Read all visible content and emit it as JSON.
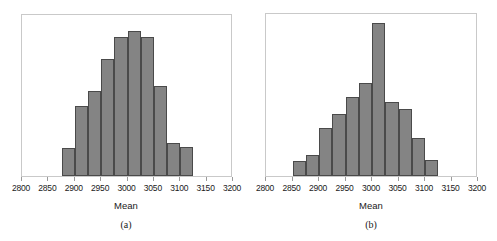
{
  "figure": {
    "panel_a_caption": "(a)",
    "panel_b_caption": "(b)"
  },
  "chart_data": [
    {
      "type": "bar",
      "subtype": "histogram",
      "panel": "(a)",
      "title": "",
      "xlabel": "Mean",
      "ylabel": "",
      "xlim": [
        2800,
        3200
      ],
      "ylim": [
        0,
        1
      ],
      "grid": false,
      "legend": null,
      "xticks": [
        2800,
        2850,
        2900,
        2950,
        3000,
        3050,
        3100,
        3150,
        3200
      ],
      "xtick_labels": [
        "2800",
        "2850",
        "2900",
        "2950",
        "3000",
        "3050",
        "3100",
        "3150",
        "3200"
      ],
      "yticks": [],
      "ytick_labels": [],
      "bin_width": 25,
      "bin_edges": [
        2875,
        2900,
        2925,
        2950,
        2975,
        3000,
        3025,
        3050,
        3075,
        3100,
        3125
      ],
      "bin_centers": [
        2887.5,
        2912.5,
        2937.5,
        2962.5,
        2987.5,
        3012.5,
        3037.5,
        3062.5,
        3087.5,
        3112.5
      ],
      "values": [
        0.17,
        0.43,
        0.52,
        0.72,
        0.85,
        0.89,
        0.85,
        0.55,
        0.2,
        0.175
      ],
      "bar_color": "#848484",
      "bar_edge_color": "#4a4a4a",
      "frame_color": "#c9c9c9"
    },
    {
      "type": "bar",
      "subtype": "histogram",
      "panel": "(b)",
      "title": "",
      "xlabel": "Mean",
      "ylabel": "",
      "xlim": [
        2800,
        3200
      ],
      "ylim": [
        0,
        1
      ],
      "grid": false,
      "legend": null,
      "xticks": [
        2800,
        2850,
        2900,
        2950,
        3000,
        3050,
        3100,
        3150,
        3200
      ],
      "xtick_labels": [
        "2800",
        "2850",
        "2900",
        "2950",
        "3000",
        "3050",
        "3100",
        "3150",
        "3200"
      ],
      "yticks": [],
      "ytick_labels": [],
      "bin_width": 25,
      "bin_edges": [
        2850,
        2875,
        2900,
        2925,
        2950,
        2975,
        3000,
        3025,
        3050,
        3075,
        3100,
        3125
      ],
      "bin_centers": [
        2862.5,
        2887.5,
        2912.5,
        2937.5,
        2962.5,
        2987.5,
        3012.5,
        3037.5,
        3062.5,
        3087.5,
        3112.5
      ],
      "values": [
        0.09,
        0.13,
        0.29,
        0.38,
        0.48,
        0.57,
        0.93,
        0.45,
        0.41,
        0.23,
        0.1
      ],
      "bar_color": "#848484",
      "bar_edge_color": "#4a4a4a",
      "frame_color": "#c9c9c9"
    }
  ]
}
